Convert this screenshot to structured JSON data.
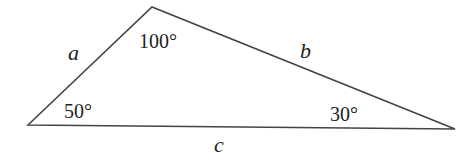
{
  "diagram": {
    "type": "triangle",
    "vertices": {
      "left": {
        "x": 28,
        "y": 125,
        "angle_label": "50°"
      },
      "top": {
        "x": 152,
        "y": 7,
        "angle_label": "100°"
      },
      "right": {
        "x": 455,
        "y": 129,
        "angle_label": "30°"
      }
    },
    "sides": {
      "a": {
        "label": "a",
        "between": [
          "left",
          "top"
        ]
      },
      "b": {
        "label": "b",
        "between": [
          "top",
          "right"
        ]
      },
      "c": {
        "label": "c",
        "between": [
          "left",
          "right"
        ]
      }
    },
    "colors": {
      "stroke": "#444444",
      "text": "#222222",
      "background": "#ffffff"
    }
  }
}
